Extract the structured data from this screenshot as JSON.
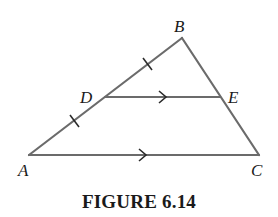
{
  "figure": {
    "caption": "FIGURE 6.14",
    "line_color": "#6b6b6b",
    "label_color": "#1a1a1a",
    "points": {
      "A": {
        "label": "A",
        "x": 29,
        "y": 155
      },
      "B": {
        "label": "B",
        "x": 182,
        "y": 38
      },
      "C": {
        "label": "C",
        "x": 259,
        "y": 155
      },
      "D": {
        "label": "D",
        "x": 105,
        "y": 97
      },
      "E": {
        "label": "E",
        "x": 220,
        "y": 97
      }
    },
    "segments": [
      "AB",
      "BC",
      "AC",
      "DE"
    ],
    "annotations": {
      "congruent_ticks": [
        "AD",
        "DB"
      ],
      "parallel_arrows": [
        "DE",
        "AC"
      ]
    }
  }
}
